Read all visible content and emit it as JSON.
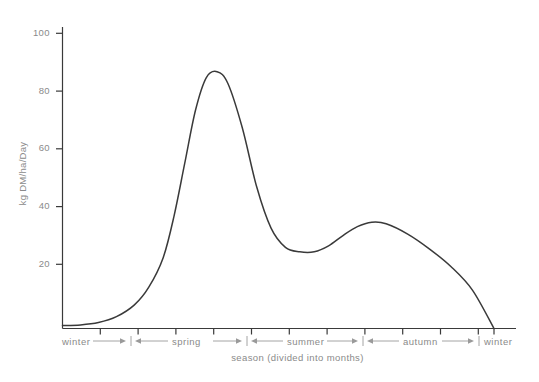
{
  "chart_data": {
    "type": "line",
    "title": "",
    "xlabel": "season (divided into months)",
    "ylabel": "kg DM/ha/Day",
    "ylim": [
      0,
      100
    ],
    "y_ticks": [
      20,
      40,
      60,
      80,
      100
    ],
    "y_tick_labels": [
      "20",
      "40",
      "60",
      "80",
      "100"
    ],
    "grid": false,
    "legend": "none",
    "x_axis_kind": "month-ticks",
    "x_tick_count": 12,
    "x_tick_labels": [
      "",
      "",
      "",
      "",
      "",
      "",
      "",
      "",
      "",
      "",
      "",
      ""
    ],
    "season_segments": [
      {
        "name": "winter",
        "label": "winter",
        "start_month": 0,
        "end_month": 1
      },
      {
        "name": "spring",
        "label": "spring",
        "start_month": 1,
        "end_month": 4
      },
      {
        "name": "summer",
        "label": "summer",
        "start_month": 4,
        "end_month": 7
      },
      {
        "name": "autumn",
        "label": "autumn",
        "start_month": 7,
        "end_month": 10
      },
      {
        "name": "winter-end",
        "label": "winter",
        "start_month": 10,
        "end_month": 12
      }
    ],
    "series": [
      {
        "name": "grass growth rate",
        "color": "#3a3a3a",
        "x": [
          0.0,
          0.5,
          1.0,
          1.5,
          2.0,
          2.4,
          2.8,
          3.1,
          3.4,
          3.7,
          4.0,
          4.3,
          4.6,
          5.0,
          5.4,
          5.8,
          6.2,
          6.6,
          7.0,
          7.4,
          7.8,
          8.2,
          8.6,
          9.0,
          9.6,
          10.2,
          10.8,
          11.4,
          12.0
        ],
        "values": [
          1.0,
          1.2,
          2.0,
          4.0,
          8.0,
          14.0,
          24.0,
          38.0,
          56.0,
          74.0,
          85.0,
          87.0,
          83.0,
          68.0,
          48.0,
          34.0,
          27.5,
          26.0,
          26.0,
          28.0,
          31.5,
          34.5,
          36.0,
          35.5,
          32.0,
          27.0,
          21.0,
          13.0,
          0.0
        ]
      }
    ],
    "annotations": []
  },
  "axis": {
    "y_title": "kg DM/ha/Day",
    "x_caption": "season (divided into months)"
  }
}
